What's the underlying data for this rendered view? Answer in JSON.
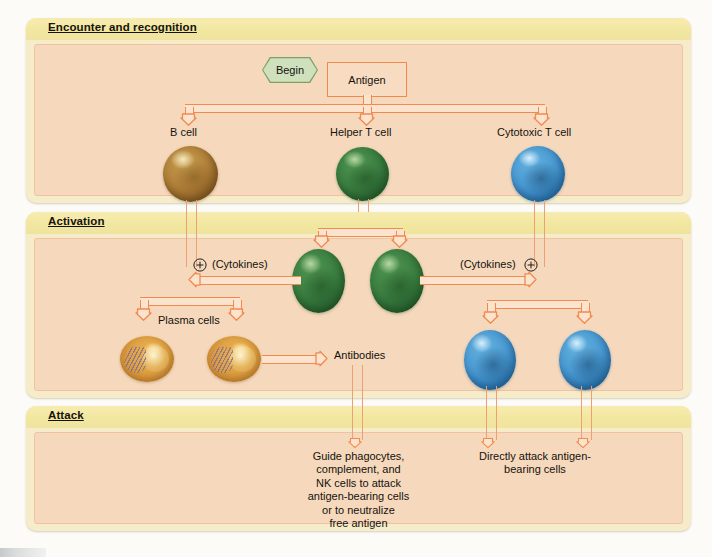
{
  "diagram": {
    "colors": {
      "header_band": "#f2e79f",
      "panel_body": "#f6d9bd",
      "panel_frame": "#f6ecc9",
      "arrow_outline": "#f08a4e",
      "arrow_fill": "#fbe3cd",
      "b_cell": "#b2823a",
      "t_cell": "#3c8042",
      "cytotoxic_cell": "#4a9ad2",
      "plasma_cell": "#e0a244",
      "begin_fill": "#cfe0bd",
      "begin_border": "#7da065"
    },
    "stages": [
      {
        "id": "encounter",
        "label": "Encounter and recognition"
      },
      {
        "id": "activation",
        "label": "Activation"
      },
      {
        "id": "attack",
        "label": "Attack"
      }
    ],
    "nodes": {
      "begin": "Begin",
      "antigen": "Antigen",
      "b_cell": "B cell",
      "helper_t_cell": "Helper T cell",
      "cytotoxic_t_cell": "Cytotoxic T cell",
      "cytokines_left": "(Cytokines)",
      "cytokines_right": "(Cytokines)",
      "plus_left": "+",
      "plus_right": "+",
      "plasma_cells": "Plasma cells",
      "antibodies": "Antibodies",
      "outcome_antibodies": "Guide phagocytes, complement, and NK cells to attack antigen-bearing cells or to neutralize free antigen",
      "outcome_cytotoxic": "Directly attack antigen-bearing cells"
    },
    "outcome_antibodies_lines": [
      "Guide phagocytes,",
      "complement, and",
      "NK cells to attack",
      "antigen-bearing cells",
      "or to neutralize",
      "free antigen"
    ],
    "outcome_cytotoxic_lines": [
      "Directly attack antigen-",
      "bearing cells"
    ]
  }
}
